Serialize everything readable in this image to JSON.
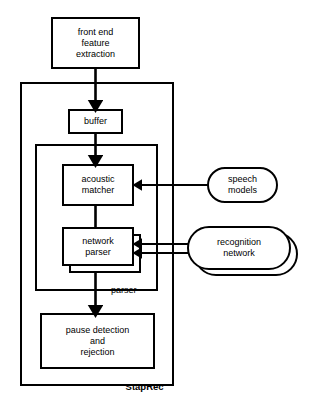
{
  "diagram": {
    "container_label": "StapRec",
    "stroke_color": "#000000",
    "fill_color": "#ffffff",
    "background": "#ffffff",
    "nodes": {
      "front_end": {
        "line1": "front end",
        "line2": "feature",
        "line3": "extraction"
      },
      "buffer": {
        "line1": "buffer"
      },
      "acoustic_matcher": {
        "line1": "acoustic",
        "line2": "matcher"
      },
      "network_parser": {
        "line1": "network",
        "line2": "parser"
      },
      "parser_group": {
        "line1": "parser"
      },
      "pause_detection": {
        "line1": "pause detection",
        "line2": "and",
        "line3": "rejection"
      },
      "speech_models": {
        "line1": "speech",
        "line2": "models"
      },
      "recognition_network": {
        "line1": "recognition",
        "line2": "network"
      }
    },
    "edges": [
      {
        "name": "front-end-to-buffer",
        "from": "front_end",
        "to": "buffer",
        "arrow": "down"
      },
      {
        "name": "buffer-to-acoustic-matcher",
        "from": "buffer",
        "to": "acoustic_matcher",
        "arrow": "down"
      },
      {
        "name": "acoustic-matcher-to-network-parser",
        "from": "acoustic_matcher",
        "to": "network_parser",
        "arrow": "none"
      },
      {
        "name": "speech-models-to-acoustic-matcher",
        "from": "speech_models",
        "to": "acoustic_matcher",
        "arrow": "left"
      },
      {
        "name": "recognition-network-to-network-parser-upper",
        "from": "recognition_network",
        "to": "network_parser",
        "arrow": "left"
      },
      {
        "name": "recognition-network-to-network-parser-lower",
        "from": "recognition_network",
        "to": "network_parser",
        "arrow": "left"
      },
      {
        "name": "parser-to-pause-detection",
        "from": "parser_group",
        "to": "pause_detection",
        "arrow": "down"
      }
    ]
  }
}
